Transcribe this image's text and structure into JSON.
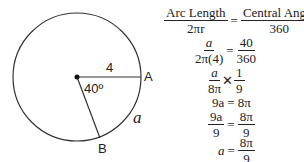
{
  "diagram": {
    "radius_label": "4",
    "angle_label": "40º",
    "point_a": "A",
    "point_b": "B",
    "arc_label": "a",
    "stroke_color": "#333333"
  },
  "equations": {
    "line1": {
      "left_num": "Arc Length",
      "left_den": "2πr",
      "op": "=",
      "right_num": "Central Angle",
      "right_den": "360"
    },
    "line2": {
      "left_num": "a",
      "left_den": "2π(4)",
      "op": "=",
      "right_num": "40",
      "right_den": "360"
    },
    "line3": {
      "left_num": "a",
      "left_den": "8π",
      "op": "✕",
      "right_num": "1",
      "right_den": "9"
    },
    "line4": {
      "left": "9a",
      "op": "=",
      "right": "8π"
    },
    "line5": {
      "left_num": "9a",
      "left_den": "9",
      "op": "=",
      "right_num": "8π",
      "right_den": "9"
    },
    "line6": {
      "left": "a",
      "op": "=",
      "right_num": "8π",
      "right_den": "9"
    }
  }
}
